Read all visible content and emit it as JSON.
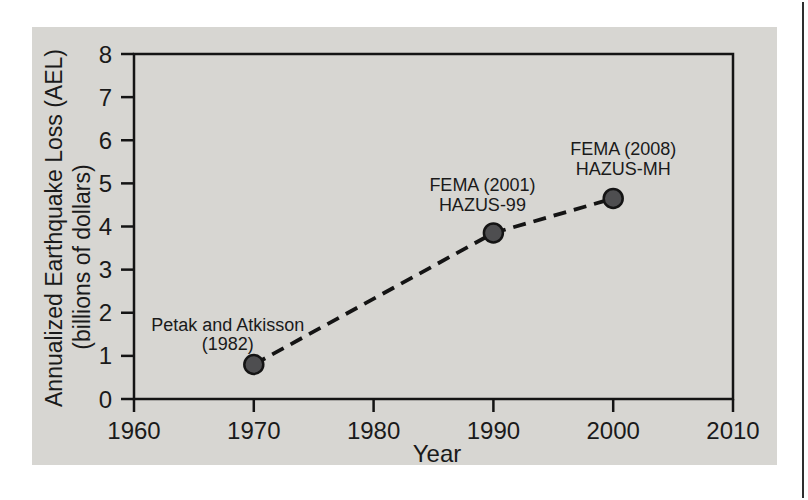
{
  "figure": {
    "width": 808,
    "height": 500,
    "background_color": "#ffffff",
    "panel_color": "#d7d6d2",
    "scan_line_color": "#2e2e2e"
  },
  "chart_data": {
    "type": "scatter",
    "title": "",
    "xlabel": "Year",
    "ylabel_line1": "Annualized Earthquake Loss (AEL)",
    "ylabel_line2": "(billions of dollars)",
    "xlim": [
      1960,
      2010
    ],
    "ylim": [
      0,
      8
    ],
    "x_ticks": [
      "1960",
      "1970",
      "1980",
      "1990",
      "2000",
      "2010"
    ],
    "y_ticks": [
      "0",
      "1",
      "2",
      "3",
      "4",
      "5",
      "6",
      "7",
      "8"
    ],
    "grid": false,
    "legend": "none",
    "line_style": "dashed",
    "line_color": "#141414",
    "axis_color": "#141414",
    "text_color": "#1a1a1a",
    "marker_fill": "#4e4e50",
    "marker_edge": "#141414",
    "points": [
      {
        "x": 1970,
        "y": 0.8,
        "label_line1": "Petak and Atkisson",
        "label_line2": "(1982)",
        "label_position": "above-left"
      },
      {
        "x": 1990,
        "y": 3.85,
        "label_line1": "FEMA (2001)",
        "label_line2": "HAZUS-99",
        "label_position": "above-left"
      },
      {
        "x": 2000,
        "y": 4.65,
        "label_line1": "FEMA (2008)",
        "label_line2": "HAZUS-MH",
        "label_position": "above-right"
      }
    ]
  }
}
